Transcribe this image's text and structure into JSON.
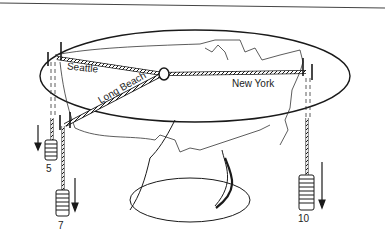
{
  "diagram": {
    "cities": [
      {
        "name": "Seattle",
        "weight": "5"
      },
      {
        "name": "Long Beach",
        "weight": "7"
      },
      {
        "name": "New York",
        "weight": "10"
      }
    ],
    "labels": {
      "seattle": "Seattle",
      "long_beach": "Long Beach",
      "new_york": "New York"
    },
    "weights": {
      "seattle_weight": "5",
      "long_beach_weight": "7",
      "new_york_weight": "10"
    },
    "colors": {
      "ink": "#1a1a1a",
      "background": "#ffffff"
    }
  }
}
